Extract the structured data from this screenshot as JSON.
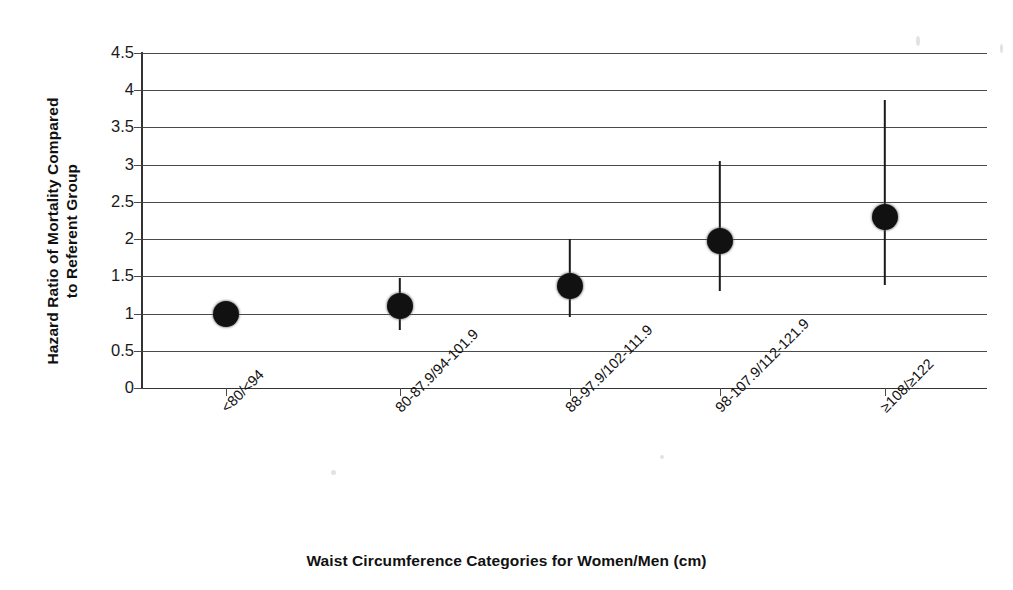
{
  "chart_data": {
    "type": "scatter",
    "title": "",
    "xlabel": "Waist Circumference Categories for Women/Men (cm)",
    "ylabel": "Hazard Ratio of Mortality Compared\nto Referent Group",
    "ylim": [
      0,
      4.5
    ],
    "yticks": [
      0,
      0.5,
      1,
      1.5,
      2,
      2.5,
      3,
      3.5,
      4,
      4.5
    ],
    "ytick_labels": [
      "0",
      "0.5",
      "1",
      "1.5",
      "2",
      "2.5",
      "3",
      "3.5",
      "4",
      "4.5"
    ],
    "grid": "horizontal",
    "legend": "none",
    "categories": [
      "<80/<94",
      "80-87.9/94-101.9",
      "88-97.9/102-111.9",
      "98-107.9/112-121.9",
      "≥108/≥122"
    ],
    "series": [
      {
        "name": "Hazard Ratio",
        "marker": "filled-circle",
        "values": [
          1.0,
          1.1,
          1.37,
          1.97,
          2.3
        ],
        "ci_low": [
          null,
          0.78,
          0.95,
          1.3,
          1.38
        ],
        "ci_high": [
          null,
          1.48,
          2.0,
          3.05,
          3.87
        ]
      }
    ],
    "points": [
      {
        "category": "<80/<94",
        "value": 1.0,
        "ci_low": null,
        "ci_high": null,
        "referent": true
      },
      {
        "category": "80-87.9/94-101.9",
        "value": 1.1,
        "ci_low": 0.78,
        "ci_high": 1.48,
        "referent": false
      },
      {
        "category": "88-97.9/102-111.9",
        "value": 1.37,
        "ci_low": 0.95,
        "ci_high": 2.0,
        "referent": false
      },
      {
        "category": "98-107.9/112-121.9",
        "value": 1.97,
        "ci_low": 1.3,
        "ci_high": 3.05,
        "referent": false
      },
      {
        "category": "≥108/≥122",
        "value": 2.3,
        "ci_low": 1.38,
        "ci_high": 3.87,
        "referent": false
      }
    ],
    "colors": {
      "marker": "#111111",
      "errorbar": "#1a1a1a",
      "gridline": "#4a4a4a",
      "axis": "#333333",
      "background": "#ffffff"
    }
  },
  "axes": {
    "y_title": "Hazard Ratio of Mortality Compared\nto Referent Group",
    "x_title": "Waist Circumference Categories for Women/Men (cm)"
  }
}
